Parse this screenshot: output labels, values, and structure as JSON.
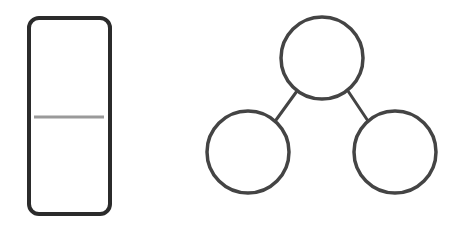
{
  "canvas": {
    "width": 457,
    "height": 228,
    "background": "#ffffff"
  },
  "panel": {
    "shape": "rounded-rectangle",
    "x": 29,
    "y": 18,
    "width": 81,
    "height": 196,
    "radius": 10,
    "stroke": "#2b2b2b",
    "stroke_width": 4,
    "divider": {
      "x1": 34,
      "x2": 104,
      "y": 117,
      "stroke": "#9a9a9a",
      "stroke_width": 3
    }
  },
  "tree": {
    "stroke": "#444444",
    "node_stroke_width": 3.5,
    "edge_stroke_width": 3,
    "nodes": [
      {
        "id": "root",
        "cx": 322,
        "cy": 58,
        "r": 41
      },
      {
        "id": "left-child",
        "cx": 248,
        "cy": 152,
        "r": 41
      },
      {
        "id": "right-child",
        "cx": 395,
        "cy": 152,
        "r": 41
      }
    ],
    "edges": [
      {
        "from": "root",
        "to": "left-child",
        "x1": 297,
        "y1": 91,
        "x2": 276,
        "y2": 120
      },
      {
        "from": "root",
        "to": "right-child",
        "x1": 348,
        "y1": 91,
        "x2": 368,
        "y2": 121
      }
    ]
  }
}
